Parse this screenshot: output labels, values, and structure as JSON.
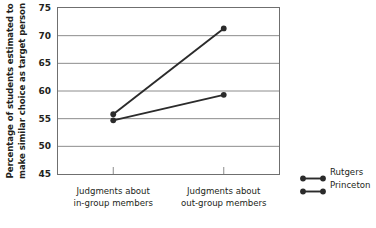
{
  "chart_data": {
    "type": "line",
    "title": "",
    "xlabel": "",
    "ylabel": "Percentage of students estimated to make similar choice as target person",
    "ylabel_lines": [
      "Percentage of students estimated to",
      "make similar choice as target person"
    ],
    "categories": [
      "Judgments about in-group members",
      "Judgments about out-group members"
    ],
    "category_lines": [
      [
        "Judgments about",
        "in-group members"
      ],
      [
        "Judgments about",
        "out-group members"
      ]
    ],
    "series": [
      {
        "name": "Rutgers",
        "values": [
          55.8,
          71.3
        ]
      },
      {
        "name": "Princeton",
        "values": [
          54.7,
          59.3
        ]
      }
    ],
    "ylim": [
      45,
      75
    ],
    "yticks": [
      45,
      50,
      55,
      60,
      65,
      70,
      75
    ],
    "ytick_labels": [
      "45",
      "50",
      "55",
      "60",
      "65",
      "70",
      "75"
    ],
    "grid": true,
    "grid_axis": "y",
    "legend_position": "right",
    "marker": "circle",
    "line_color": "#2b2b2b",
    "grid_color": "#8c8c8c",
    "frame_color": "#6f6f6f",
    "text_color": "#231f20"
  },
  "legend": {
    "items": [
      {
        "label": "Rutgers"
      },
      {
        "label": "Princeton"
      }
    ]
  }
}
